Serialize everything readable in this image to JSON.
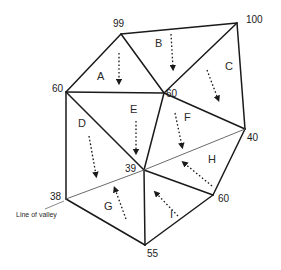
{
  "diagram": {
    "title": "",
    "vertices": {
      "v99": {
        "label": "99",
        "x": 121,
        "y": 34
      },
      "v100": {
        "label": "100",
        "x": 237,
        "y": 23
      },
      "v60a": {
        "label": "60",
        "x": 66,
        "y": 92
      },
      "v60b": {
        "label": "60",
        "x": 164,
        "y": 93
      },
      "v40": {
        "label": "40",
        "x": 245,
        "y": 129
      },
      "v39": {
        "label": "39",
        "x": 144,
        "y": 170
      },
      "v38": {
        "label": "38",
        "x": 66,
        "y": 199
      },
      "v60c": {
        "label": "60",
        "x": 213,
        "y": 195
      },
      "v55": {
        "label": "55",
        "x": 145,
        "y": 245
      }
    },
    "faces": {
      "A": {
        "label": "A"
      },
      "B": {
        "label": "B"
      },
      "C": {
        "label": "C"
      },
      "D": {
        "label": "D"
      },
      "E": {
        "label": "E"
      },
      "F": {
        "label": "F"
      },
      "G": {
        "label": "G"
      },
      "H": {
        "label": "H"
      },
      "I": {
        "label": "I"
      }
    },
    "valley_annotation": "Line of valley",
    "colors": {
      "edge": "#1a1a1a",
      "valley_line": "#6b6b6b",
      "background": "#ffffff"
    }
  }
}
